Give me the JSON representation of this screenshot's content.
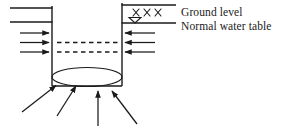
{
  "diagram": {
    "type": "engineering-section-sketch",
    "canvas": {
      "width": 287,
      "height": 132,
      "background": "#ffffff"
    },
    "stroke_color": "#1a1a1a",
    "labels": {
      "ground_level": "Ground level",
      "normal_water_table": "Normal water table"
    },
    "symbols": {
      "ground_hatch": "X X X",
      "water_table_marker": "inverted-triangle",
      "water_table_marker_glyph": "▽"
    },
    "geometry": {
      "shaft_left_wall_x": 52,
      "shaft_right_wall_x": 122,
      "shaft_top_y": 6,
      "shaft_bottom_y": 85,
      "left_ground_line_y": 8,
      "left_water_line_y": 22,
      "right_ground_line_y": 5,
      "right_water_line_y": 23,
      "right_line_end_x": 176,
      "left_line_start_x": 10,
      "ellipse_center_x": 87,
      "ellipse_center_y": 77,
      "ellipse_rx": 35,
      "ellipse_ry": 9.5
    },
    "flow_arrows": {
      "left_inflow": {
        "count": 3,
        "direction": "right",
        "rows_y": [
          33,
          42.5,
          52
        ],
        "start_x": 20,
        "end_x": 52
      },
      "right_inflow": {
        "count": 3,
        "direction": "left",
        "rows_y": [
          33,
          42.5,
          52
        ],
        "start_x": 155,
        "end_x": 122
      },
      "bottom_uplift": {
        "count": 4,
        "direction": "up",
        "tips": [
          {
            "x": 54,
            "y": 85
          },
          {
            "x": 75,
            "y": 85
          },
          {
            "x": 98,
            "y": 90
          },
          {
            "x": 113,
            "y": 90
          }
        ],
        "tails": [
          {
            "x": 22,
            "y": 112
          },
          {
            "x": 57,
            "y": 116
          },
          {
            "x": 98,
            "y": 126
          },
          {
            "x": 137,
            "y": 124
          }
        ]
      }
    },
    "seepage_lines": {
      "count": 2,
      "style": "dashed",
      "rows_y": [
        42.5,
        52
      ],
      "start_x": 57,
      "end_x": 118
    },
    "base_line": {
      "y": 86,
      "start_x": 52,
      "end_x": 122
    }
  }
}
